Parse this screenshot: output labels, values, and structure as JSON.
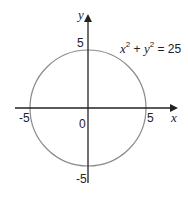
{
  "diagram": {
    "type": "circle-on-coordinate-axes",
    "equation": {
      "x_term": "x",
      "y_term": "y",
      "exponent": "2",
      "plus": " + ",
      "equals": " = 25"
    },
    "axes": {
      "x_label": "x",
      "y_label": "y"
    },
    "ticks": {
      "x_pos": "5",
      "x_neg": "-5",
      "y_pos": "5",
      "y_neg": "-5",
      "origin": "0"
    },
    "circle": {
      "center": [
        0,
        0
      ],
      "radius": 5
    },
    "colors": {
      "axis": "#222222",
      "circle": "#8a8a8a"
    }
  }
}
